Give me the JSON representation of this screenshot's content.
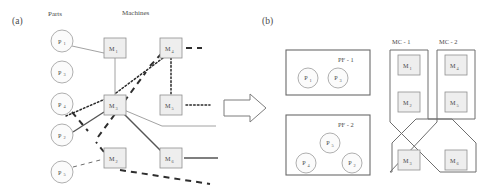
{
  "figure": {
    "panel_a_label": "(a)",
    "panel_b_label": "(b)",
    "column_headers": {
      "parts": "Parts",
      "machines": "Machines"
    },
    "arrow_icon": "right-arrow-icon"
  },
  "panel_a": {
    "parts": [
      {
        "id": "P1",
        "base": "P",
        "sub": "1",
        "cx": 62,
        "cy": 41,
        "r": 11
      },
      {
        "id": "P3",
        "base": "P",
        "sub": "3",
        "cx": 62,
        "cy": 72,
        "r": 11
      },
      {
        "id": "P4",
        "base": "P",
        "sub": "4",
        "cx": 62,
        "cy": 104,
        "r": 11
      },
      {
        "id": "P2",
        "base": "P",
        "sub": "2",
        "cx": 62,
        "cy": 135,
        "r": 11
      },
      {
        "id": "P5",
        "base": "P",
        "sub": "5",
        "cx": 62,
        "cy": 172,
        "r": 11
      }
    ],
    "machines": [
      {
        "id": "M1",
        "base": "M",
        "sub": "1",
        "x": 104,
        "y": 38,
        "w": 22,
        "h": 20
      },
      {
        "id": "M2",
        "base": "M",
        "sub": "3",
        "x": 104,
        "y": 95,
        "w": 22,
        "h": 20
      },
      {
        "id": "M3",
        "base": "M",
        "sub": "2",
        "x": 104,
        "y": 148,
        "w": 22,
        "h": 20
      },
      {
        "id": "M4",
        "base": "M",
        "sub": "4",
        "x": 160,
        "y": 38,
        "w": 22,
        "h": 20
      },
      {
        "id": "M5",
        "base": "M",
        "sub": "5",
        "x": 160,
        "y": 95,
        "w": 22,
        "h": 20
      },
      {
        "id": "M6",
        "base": "M",
        "sub": "6",
        "x": 160,
        "y": 148,
        "w": 22,
        "h": 20
      }
    ],
    "edge_styles": [
      "solid",
      "dotted",
      "dashed",
      "solid-dark"
    ]
  },
  "panel_b": {
    "part_families": [
      {
        "label": "PF - 1",
        "box": {
          "x": 286,
          "y": 50,
          "w": 84,
          "h": 45
        },
        "members": [
          {
            "id": "P1",
            "base": "P",
            "sub": "1",
            "cx": 308,
            "cy": 76,
            "r": 10
          },
          {
            "id": "P3",
            "base": "P",
            "sub": "3",
            "cx": 338,
            "cy": 76,
            "r": 10
          }
        ]
      },
      {
        "label": "PF - 2",
        "box": {
          "x": 286,
          "y": 115,
          "w": 84,
          "h": 60
        },
        "members": [
          {
            "id": "P5",
            "base": "P",
            "sub": "5",
            "cx": 330,
            "cy": 140,
            "r": 10
          },
          {
            "id": "P4",
            "base": "P",
            "sub": "4",
            "cx": 306,
            "cy": 162,
            "r": 10
          },
          {
            "id": "P2",
            "base": "P",
            "sub": "2",
            "cx": 352,
            "cy": 162,
            "r": 10
          }
        ]
      }
    ],
    "machine_cells": [
      {
        "label": "MC - 1",
        "label_x": 406,
        "label_y": 43,
        "machines": [
          {
            "id": "M1",
            "base": "M",
            "sub": "1",
            "x": 398,
            "y": 55,
            "w": 22,
            "h": 20
          },
          {
            "id": "M2",
            "base": "M",
            "sub": "2",
            "x": 398,
            "y": 92,
            "w": 22,
            "h": 20
          },
          {
            "id": "M3",
            "base": "M",
            "sub": "3",
            "x": 398,
            "y": 150,
            "w": 22,
            "h": 20
          }
        ]
      },
      {
        "label": "MC - 2",
        "label_x": 453,
        "label_y": 43,
        "machines": [
          {
            "id": "M4",
            "base": "M",
            "sub": "4",
            "x": 445,
            "y": 55,
            "w": 22,
            "h": 20
          },
          {
            "id": "M5",
            "base": "M",
            "sub": "5",
            "x": 445,
            "y": 92,
            "w": 22,
            "h": 20
          },
          {
            "id": "M6",
            "base": "M",
            "sub": "6",
            "x": 445,
            "y": 150,
            "w": 22,
            "h": 20
          }
        ]
      }
    ]
  },
  "colors": {
    "node_fill": "#eeeeee",
    "circle_fill": "#fbfbfb",
    "stroke": "#8f8f8f",
    "text": "#4a4a4a",
    "edge_dark": "#2a2a2a"
  }
}
